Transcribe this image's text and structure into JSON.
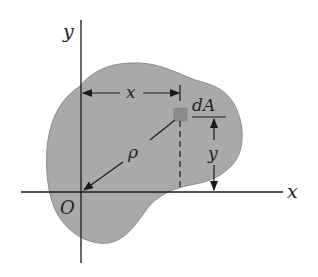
{
  "diagram": {
    "colors": {
      "region_fill": "#a9a9a9",
      "region_stroke": "#8a8a8a",
      "element_fill": "#8c8c8c",
      "line": "#1a1a1a"
    },
    "labels": {
      "y_axis": "y",
      "x_axis": "x",
      "origin": "O",
      "element": "dA",
      "x_dim": "x",
      "y_dim": "y",
      "rho": "ρ"
    }
  }
}
